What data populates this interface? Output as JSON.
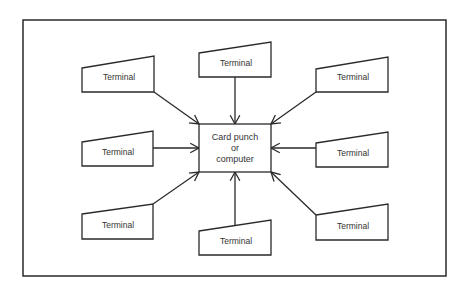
{
  "diagram": {
    "type": "star-network",
    "center": {
      "lines": [
        "Card punch",
        "or",
        "computer"
      ],
      "box": [
        199,
        124,
        271,
        172
      ]
    },
    "terminals": [
      {
        "label": "Terminal",
        "pos": "top-left",
        "poly": [
          [
            82,
            68
          ],
          [
            154,
            56
          ],
          [
            154,
            92
          ],
          [
            82,
            92
          ]
        ],
        "from": [
          154,
          92
        ],
        "to": [
          199,
          124
        ]
      },
      {
        "label": "Terminal",
        "pos": "top-center",
        "poly": [
          [
            199,
            53
          ],
          [
            271,
            42
          ],
          [
            271,
            77
          ],
          [
            199,
            77
          ]
        ],
        "from": [
          235,
          77
        ],
        "to": [
          235,
          124
        ]
      },
      {
        "label": "Terminal",
        "pos": "top-right",
        "poly": [
          [
            316,
            69
          ],
          [
            388,
            57
          ],
          [
            388,
            92
          ],
          [
            316,
            92
          ]
        ],
        "from": [
          316,
          92
        ],
        "to": [
          271,
          124
        ]
      },
      {
        "label": "Terminal",
        "pos": "middle-left",
        "poly": [
          [
            82,
            142
          ],
          [
            153,
            131
          ],
          [
            153,
            166
          ],
          [
            82,
            166
          ]
        ],
        "from": [
          153,
          148
        ],
        "to": [
          199,
          148
        ]
      },
      {
        "label": "Terminal",
        "pos": "middle-right",
        "poly": [
          [
            316,
            143
          ],
          [
            388,
            132
          ],
          [
            388,
            167
          ],
          [
            316,
            167
          ]
        ],
        "from": [
          316,
          148
        ],
        "to": [
          271,
          148
        ]
      },
      {
        "label": "Terminal",
        "pos": "bottom-left",
        "poly": [
          [
            82,
            214
          ],
          [
            153,
            204
          ],
          [
            153,
            239
          ],
          [
            82,
            239
          ]
        ],
        "from": [
          153,
          204
        ],
        "to": [
          199,
          172
        ]
      },
      {
        "label": "Terminal",
        "pos": "bottom-center",
        "poly": [
          [
            199,
            231
          ],
          [
            271,
            220
          ],
          [
            271,
            255
          ],
          [
            199,
            255
          ]
        ],
        "from": [
          235,
          226
        ],
        "to": [
          235,
          172
        ]
      },
      {
        "label": "Terminal",
        "pos": "bottom-right",
        "poly": [
          [
            316,
            215
          ],
          [
            388,
            204
          ],
          [
            388,
            240
          ],
          [
            316,
            240
          ]
        ],
        "from": [
          316,
          215
        ],
        "to": [
          271,
          172
        ]
      }
    ],
    "frame": [
      23,
      20,
      446,
      276
    ],
    "colors": {
      "stroke": "#2a2a2a",
      "text": "#333333",
      "background": "#ffffff"
    }
  }
}
